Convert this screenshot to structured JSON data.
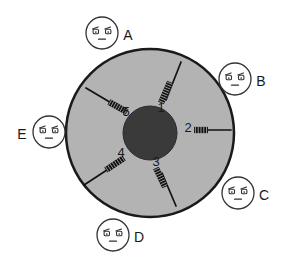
{
  "diagram": {
    "canvas": {
      "width": 287,
      "height": 267,
      "background": "#ffffff"
    },
    "colors": {
      "disk_fill": "#b3b3b3",
      "disk_stroke": "#1a1a1a",
      "hub_fill": "#3a3a3a",
      "needle": "#111111",
      "face_stroke": "#333333",
      "face_fill": "#ffffff",
      "label_text": "#1a1a1a"
    },
    "disk": {
      "cx": 150,
      "cy": 133,
      "r": 84,
      "stroke_width": 2.5
    },
    "hub": {
      "cx": 150,
      "cy": 133,
      "r": 27
    },
    "needles": [
      {
        "id": "needle-1",
        "number": "1",
        "angle_deg": -68,
        "head_at": "inner",
        "label_x": 161,
        "label_y": 112,
        "shaft": {
          "x1": 166,
          "y1": 100,
          "x2": 181,
          "y2": 62
        },
        "head": {
          "x1": 161,
          "y1": 103,
          "x2": 170,
          "y2": 82
        }
      },
      {
        "id": "needle-2",
        "number": "2",
        "angle_deg": 0,
        "head_at": "inner",
        "label_x": 188,
        "label_y": 132,
        "shaft": {
          "x1": 206,
          "y1": 130,
          "x2": 231,
          "y2": 130
        },
        "head": {
          "x1": 194,
          "y1": 130,
          "x2": 208,
          "y2": 130
        }
      },
      {
        "id": "needle-3",
        "number": "3",
        "angle_deg": 68,
        "head_at": "inner",
        "label_x": 156,
        "label_y": 166,
        "shaft": {
          "x1": 162,
          "y1": 173,
          "x2": 176,
          "y2": 206
        },
        "head": {
          "x1": 156,
          "y1": 168,
          "x2": 165,
          "y2": 187
        }
      },
      {
        "id": "needle-4",
        "number": "4",
        "angle_deg": 210,
        "head_at": "inner",
        "label_x": 121,
        "label_y": 157,
        "shaft": {
          "x1": 110,
          "y1": 168,
          "x2": 84,
          "y2": 185
        },
        "head": {
          "x1": 124,
          "y1": 158,
          "x2": 106,
          "y2": 170
        }
      },
      {
        "id": "needle-5",
        "number": "5",
        "angle_deg": 145,
        "head_at": "inner",
        "label_x": 126,
        "label_y": 116,
        "shaft": {
          "x1": 113,
          "y1": 104,
          "x2": 86,
          "y2": 88
        },
        "head": {
          "x1": 127,
          "y1": 112,
          "x2": 109,
          "y2": 102
        }
      }
    ],
    "faces": [
      {
        "id": "face-a",
        "label": "A",
        "cx": 102,
        "cy": 33,
        "r": 16,
        "label_x": 128,
        "label_y": 40,
        "label_side": "right"
      },
      {
        "id": "face-b",
        "label": "B",
        "cx": 235,
        "cy": 79,
        "r": 16,
        "label_x": 261,
        "label_y": 86,
        "label_side": "right"
      },
      {
        "id": "face-c",
        "label": "C",
        "cx": 238,
        "cy": 193,
        "r": 16,
        "label_x": 264,
        "label_y": 200,
        "label_side": "right"
      },
      {
        "id": "face-d",
        "label": "D",
        "cx": 113,
        "cy": 235,
        "r": 16,
        "label_x": 139,
        "label_y": 242,
        "label_side": "right"
      },
      {
        "id": "face-e",
        "label": "E",
        "cx": 49,
        "cy": 132,
        "r": 16,
        "label_x": 22,
        "label_y": 139,
        "label_side": "left"
      }
    ],
    "face_glyph": {
      "description": "flat-expression face: two lidded eyes with slanted brow strokes and a short straight mouth",
      "eye_offset_x": 6.2,
      "eye_offset_y": -1.5,
      "eye_w": 5.4,
      "eye_h": 4.4,
      "mouth_w": 7
    }
  }
}
